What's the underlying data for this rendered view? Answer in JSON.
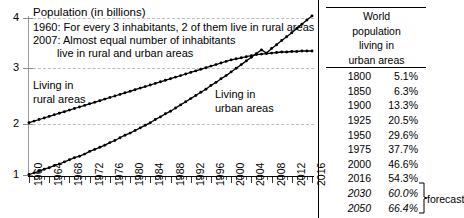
{
  "chart_data": {
    "type": "line",
    "title": "Population (in billions)",
    "xlabel": "",
    "ylabel": "Population (in billions)",
    "ylim": [
      1,
      4
    ],
    "xlim": [
      1960,
      2016
    ],
    "yticks": [
      1,
      2,
      3,
      4
    ],
    "grid": true,
    "legend_position": "inline-annotations",
    "x": [
      1960,
      1961,
      1962,
      1963,
      1964,
      1965,
      1966,
      1967,
      1968,
      1969,
      1970,
      1971,
      1972,
      1973,
      1974,
      1975,
      1976,
      1977,
      1978,
      1979,
      1980,
      1981,
      1982,
      1983,
      1984,
      1985,
      1986,
      1987,
      1988,
      1989,
      1990,
      1991,
      1992,
      1993,
      1994,
      1995,
      1996,
      1997,
      1998,
      1999,
      2000,
      2001,
      2002,
      2003,
      2004,
      2005,
      2006,
      2007,
      2008,
      2009,
      2010,
      2011,
      2012,
      2013,
      2014,
      2015,
      2016
    ],
    "xtick_labels": [
      "1960",
      "1964",
      "1968",
      "1972",
      "1976",
      "1980",
      "1984",
      "1988",
      "1992",
      "1996",
      "2000",
      "2004",
      "2008",
      "2012",
      "2016"
    ],
    "series": [
      {
        "name": "Living in rural areas",
        "values": [
          2.0,
          2.03,
          2.06,
          2.09,
          2.12,
          2.15,
          2.18,
          2.21,
          2.24,
          2.27,
          2.3,
          2.33,
          2.36,
          2.39,
          2.42,
          2.45,
          2.48,
          2.51,
          2.54,
          2.57,
          2.6,
          2.63,
          2.66,
          2.69,
          2.72,
          2.75,
          2.78,
          2.81,
          2.84,
          2.87,
          2.9,
          2.93,
          2.96,
          2.99,
          3.02,
          3.05,
          3.08,
          3.11,
          3.14,
          3.17,
          3.2,
          3.22,
          3.24,
          3.26,
          3.28,
          3.3,
          3.31,
          3.32,
          3.33,
          3.34,
          3.35,
          3.35,
          3.36,
          3.36,
          3.37,
          3.37,
          3.37
        ]
      },
      {
        "name": "Living in urban areas",
        "values": [
          1.01,
          1.04,
          1.07,
          1.11,
          1.14,
          1.18,
          1.21,
          1.25,
          1.29,
          1.33,
          1.36,
          1.4,
          1.45,
          1.49,
          1.53,
          1.57,
          1.62,
          1.66,
          1.71,
          1.76,
          1.8,
          1.85,
          1.9,
          1.95,
          2.0,
          2.06,
          2.11,
          2.17,
          2.22,
          2.28,
          2.34,
          2.4,
          2.46,
          2.52,
          2.58,
          2.64,
          2.71,
          2.77,
          2.84,
          2.9,
          2.97,
          3.04,
          3.11,
          3.18,
          3.25,
          3.32,
          3.39,
          3.33,
          3.42,
          3.49,
          3.57,
          3.64,
          3.72,
          3.8,
          3.88,
          3.96,
          4.04
        ]
      }
    ],
    "annotations": [
      "1960: For every 3 inhabitants, 2 of them live in rural areas",
      "2007: Almost equal number of inhabitants",
      "live in rural and urban areas"
    ],
    "series_labels": {
      "rural": "Living in\nrural areas",
      "urban": "Living in\nurban areas"
    }
  },
  "axis": {
    "title": "Population (in billions)",
    "ytick_labels": [
      "4",
      "3",
      "2",
      "1"
    ],
    "xtick_labels": [
      "1960",
      "1964",
      "1968",
      "1972",
      "1976",
      "1980",
      "1984",
      "1988",
      "1992",
      "1996",
      "2000",
      "2004",
      "2008",
      "2012",
      "2016"
    ]
  },
  "notes": {
    "line1": "1960: For every 3 inhabitants, 2 of them live in rural areas",
    "line2": "2007: Almost equal number of inhabitants",
    "line3": "live in rural and urban areas"
  },
  "inline_labels": {
    "rural_l1": "Living in",
    "rural_l2": "rural areas",
    "urban_l1": "Living in",
    "urban_l2": "urban areas"
  },
  "table": {
    "header_lines": [
      "World",
      "population",
      "living in",
      "urban areas"
    ],
    "rows": [
      {
        "year": "1800",
        "pct": "5.1%",
        "forecast": false
      },
      {
        "year": "1850",
        "pct": "6.3%",
        "forecast": false
      },
      {
        "year": "1900",
        "pct": "13.3%",
        "forecast": false
      },
      {
        "year": "1925",
        "pct": "20.5%",
        "forecast": false
      },
      {
        "year": "1950",
        "pct": "29.6%",
        "forecast": false
      },
      {
        "year": "1975",
        "pct": "37.7%",
        "forecast": false
      },
      {
        "year": "2000",
        "pct": "46.6%",
        "forecast": false
      },
      {
        "year": "2016",
        "pct": "54.3%",
        "forecast": false
      },
      {
        "year": "2030",
        "pct": "60.0%",
        "forecast": true
      },
      {
        "year": "2050",
        "pct": "66.4%",
        "forecast": true
      }
    ],
    "forecast_label": "forecast"
  },
  "colors": {
    "series": "#000000",
    "gridline": "#bdbdbd",
    "axis": "#9a9a9a",
    "text": "#000000"
  }
}
